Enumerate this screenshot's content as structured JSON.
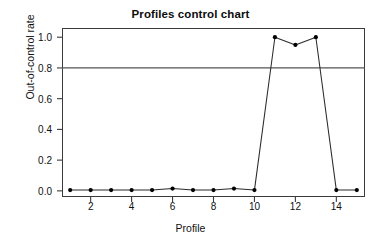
{
  "chart_data": {
    "type": "line",
    "title": "Profiles control chart",
    "xlabel": "Profile",
    "ylabel": "Out-of-control rate",
    "x": [
      1,
      2,
      3,
      4,
      5,
      6,
      7,
      8,
      9,
      10,
      11,
      12,
      13,
      14,
      15
    ],
    "values": [
      0.005,
      0.005,
      0.005,
      0.005,
      0.005,
      0.015,
      0.005,
      0.005,
      0.015,
      0.005,
      1.0,
      0.95,
      1.0,
      0.005,
      0.005
    ],
    "series": [
      {
        "name": "Out-of-control rate",
        "values": [
          0.005,
          0.005,
          0.005,
          0.005,
          0.005,
          0.015,
          0.005,
          0.005,
          0.015,
          0.005,
          1.0,
          0.95,
          1.0,
          0.005,
          0.005
        ]
      }
    ],
    "xlim": [
      0.6,
      15.4
    ],
    "ylim": [
      -0.04,
      1.06
    ],
    "xticks": [
      2,
      4,
      6,
      8,
      10,
      12,
      14
    ],
    "xtick_labels": [
      "2",
      "4",
      "6",
      "8",
      "10",
      "12",
      "14"
    ],
    "yticks": [
      0.0,
      0.2,
      0.4,
      0.6,
      0.8,
      1.0
    ],
    "ytick_labels": [
      "0.0",
      "0.2",
      "0.4",
      "0.6",
      "0.8",
      "1.0"
    ],
    "grid": false,
    "legend": "none",
    "reference_lines": [
      {
        "name": "control-limit",
        "orientation": "horizontal",
        "y": 0.8,
        "color": "#555555"
      }
    ],
    "marker": "filled-circle",
    "line_color": "#2b2b2b",
    "marker_color": "#000000",
    "frame_color": "#3b3b3b",
    "background": "#ffffff"
  }
}
